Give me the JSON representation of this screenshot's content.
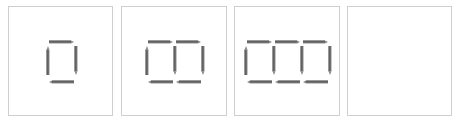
{
  "figure": {
    "colors": {
      "pencil": "#707070",
      "pencil_dark": "#555555",
      "tip": "#8a8a8a",
      "border": "#cfcfcf"
    },
    "panels": [
      {
        "label": "1 square",
        "squares": 1,
        "pencils": 4
      },
      {
        "label": "2 squares",
        "squares": 2,
        "pencils": 7
      },
      {
        "label": "3 squares",
        "squares": 3,
        "pencils": 10
      },
      {
        "label": "empty",
        "squares": 0,
        "pencils": 0
      }
    ]
  }
}
